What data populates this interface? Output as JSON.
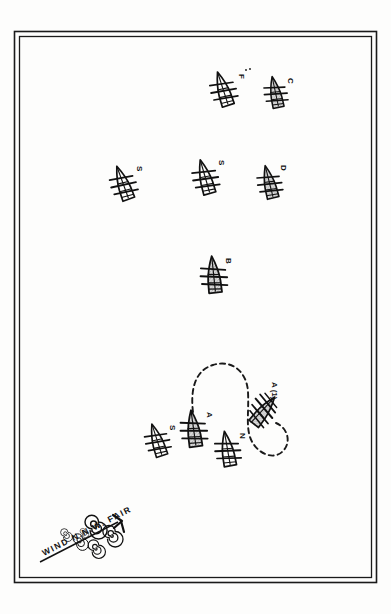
{
  "document": {
    "kind": "naval-tactical-diagram",
    "title": "Fleet Formation and Maneuver Track",
    "background_color": "#ffffff",
    "ink_color": "#111111",
    "hull_fill_color": "#d8d8d8",
    "border": {
      "outer_color": "#1a1a1a",
      "inner_color": "#1a1a1a",
      "style": "double-rule"
    }
  },
  "weather": {
    "label": "WIND N.N.W.  FAIR",
    "wind_label_words": [
      "WIND",
      "N.N.W.",
      "FAIR"
    ],
    "arrow_direction": "toward upper-right (from N.N.W.)",
    "cloud_symbol_count": 6
  },
  "track": {
    "label": "maneuver track",
    "style": "dashed",
    "description": "dashed loop running up from lower ship, over the top, and curving down and around to the damaged vessel"
  },
  "ships": [
    {
      "id": "ship-f",
      "label": "F",
      "x": 224,
      "y": 92,
      "rotation": -18,
      "scale": 1.0,
      "hull_shaded": false,
      "trailing_dots": true
    },
    {
      "id": "ship-c",
      "label": "C",
      "x": 276,
      "y": 95,
      "rotation": -12,
      "scale": 0.9,
      "hull_shaded": true,
      "trailing_dots": false
    },
    {
      "id": "ship-s1",
      "label": "S",
      "x": 124,
      "y": 186,
      "rotation": -20,
      "scale": 1.0,
      "hull_shaded": false,
      "trailing_dots": false
    },
    {
      "id": "ship-s2",
      "label": "S",
      "x": 206,
      "y": 180,
      "rotation": -16,
      "scale": 1.0,
      "hull_shaded": false,
      "trailing_dots": false
    },
    {
      "id": "ship-d",
      "label": "D",
      "x": 270,
      "y": 185,
      "rotation": -14,
      "scale": 0.95,
      "hull_shaded": true,
      "trailing_dots": false
    },
    {
      "id": "ship-b",
      "label": "B",
      "x": 214,
      "y": 278,
      "rotation": -6,
      "scale": 1.05,
      "hull_shaded": true,
      "trailing_dots": false
    },
    {
      "id": "ship-a",
      "label": "A",
      "x": 194,
      "y": 432,
      "rotation": -8,
      "scale": 1.05,
      "hull_shaded": true,
      "trailing_dots": false
    },
    {
      "id": "ship-n",
      "label": "N",
      "x": 228,
      "y": 452,
      "rotation": -10,
      "scale": 1.0,
      "hull_shaded": false,
      "trailing_dots": false
    },
    {
      "id": "ship-s3",
      "label": "S",
      "x": 158,
      "y": 443,
      "rotation": -18,
      "scale": 0.95,
      "hull_shaded": false,
      "trailing_dots": false
    }
  ],
  "damaged_ship": {
    "id": "ship-a1",
    "label": "A (1)",
    "x": 263,
    "y": 412,
    "rotation": 38,
    "state": "dismasted / heeling",
    "hull_shaded": true
  },
  "labels": {
    "wind": "WIND N.N.W.  FAIR",
    "damaged": "A (1)"
  }
}
